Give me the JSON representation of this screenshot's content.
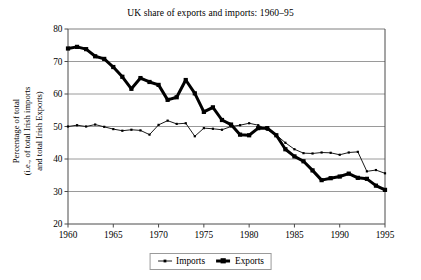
{
  "chart_data": {
    "type": "line",
    "title": "UK share of exports and imports: 1960–95",
    "xlabel": "",
    "ylabel_lines": [
      "Percentage of total",
      "(i.e., of total Irish imports",
      "and total Irish Exports)"
    ],
    "ylabel": "Percentage of total (i.e., of total Irish imports and total Irish Exports)",
    "xlim": [
      1960,
      1995
    ],
    "ylim": [
      20,
      80
    ],
    "ytick_labels": [
      "80",
      "70",
      "60",
      "50",
      "40",
      "30",
      "20"
    ],
    "yticks": [
      80,
      70,
      60,
      50,
      40,
      30,
      20
    ],
    "xtick_labels": [
      "1960",
      "1965",
      "1970",
      "1975",
      "1980",
      "1985",
      "1990",
      "1995"
    ],
    "xticks": [
      1960,
      1965,
      1970,
      1975,
      1980,
      1985,
      1990,
      1995
    ],
    "grid": "horizontal",
    "legend_position": "bottom-center",
    "x": [
      1960,
      1961,
      1962,
      1963,
      1964,
      1965,
      1966,
      1967,
      1968,
      1969,
      1970,
      1971,
      1972,
      1973,
      1974,
      1975,
      1976,
      1977,
      1978,
      1979,
      1980,
      1981,
      1982,
      1983,
      1984,
      1985,
      1986,
      1987,
      1988,
      1989,
      1990,
      1991,
      1992,
      1993,
      1994,
      1995
    ],
    "series": [
      {
        "name": "Imports",
        "color": "#000000",
        "line_width": 0.9,
        "marker": "small-dot",
        "values": [
          50.0,
          50.4,
          50.0,
          50.6,
          49.9,
          49.2,
          48.7,
          49.0,
          48.8,
          47.5,
          50.5,
          51.8,
          50.8,
          51.0,
          47.0,
          49.5,
          49.3,
          49.0,
          50.0,
          50.4,
          51.0,
          50.4,
          49.0,
          47.4,
          45.0,
          43.0,
          41.8,
          41.7,
          42.0,
          41.9,
          41.3,
          42.0,
          42.2,
          36.2,
          36.6,
          35.6
        ]
      },
      {
        "name": "Exports",
        "color": "#000000",
        "line_width": 3.0,
        "marker": "square",
        "values": [
          74.0,
          74.5,
          73.8,
          71.6,
          70.8,
          68.3,
          65.3,
          61.6,
          64.9,
          63.7,
          62.8,
          58.2,
          59.0,
          64.3,
          60.2,
          54.5,
          55.9,
          52.0,
          50.6,
          47.5,
          47.3,
          49.5,
          49.5,
          47.3,
          43.0,
          40.8,
          39.3,
          36.5,
          33.5,
          34.1,
          34.6,
          35.5,
          34.2,
          33.9,
          31.8,
          30.5
        ]
      }
    ]
  },
  "legend": {
    "entries": [
      {
        "label": "Imports",
        "style": "thin-line-dot"
      },
      {
        "label": "Exports",
        "style": "thick-line-square"
      }
    ]
  }
}
